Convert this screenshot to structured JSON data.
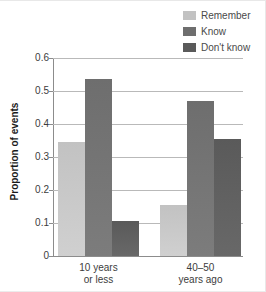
{
  "chart_data": {
    "type": "bar",
    "title": "",
    "xlabel": "",
    "ylabel": "Proportion of events",
    "ylim": [
      0,
      0.6
    ],
    "yticks": [
      "0",
      "0.1",
      "0.2",
      "0.3",
      "0.4",
      "0.5",
      "0.6"
    ],
    "ytick_values": [
      0,
      0.1,
      0.2,
      0.3,
      0.4,
      0.5,
      0.6
    ],
    "grid": true,
    "legend_position": "top-right",
    "categories": [
      "10 years or less",
      "40-50 years ago"
    ],
    "category_lines": [
      [
        "10 years",
        "or less"
      ],
      [
        "40–50",
        "years ago"
      ]
    ],
    "series": [
      {
        "name": "Remember",
        "color": "#c2c2c2",
        "values": [
          0.345,
          0.155
        ]
      },
      {
        "name": "Know",
        "color": "#6e6e6e",
        "values": [
          0.535,
          0.47
        ]
      },
      {
        "name": "Don't know",
        "color": "#5a5a5a",
        "values": [
          0.105,
          0.355
        ]
      }
    ]
  },
  "legend": {
    "items": [
      {
        "label": "Remember",
        "color": "#c2c2c2"
      },
      {
        "label": "Know",
        "color": "#6e6e6e"
      },
      {
        "label": "Don't know",
        "color": "#5a5a5a"
      }
    ]
  },
  "axes": {
    "y_title": "Proportion of events"
  }
}
